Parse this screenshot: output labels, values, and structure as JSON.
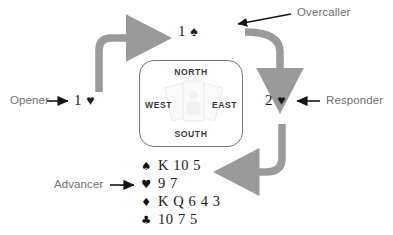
{
  "diagram": {
    "arrow_color": "#9a9a9a",
    "label_color": "#6f6f6f",
    "bid_color": "#1a1a1a"
  },
  "roles": {
    "opener": {
      "label": "Opener",
      "bid_rank": "1",
      "bid_suit": "♥",
      "bid_suit_name": "hearts"
    },
    "overcaller": {
      "label": "Overcaller",
      "bid_rank": "1",
      "bid_suit": "♠",
      "bid_suit_name": "spades"
    },
    "responder": {
      "label": "Responder",
      "bid_rank": "2",
      "bid_suit": "♥",
      "bid_suit_name": "hearts"
    },
    "advancer": {
      "label": "Advancer"
    }
  },
  "compass": {
    "north": "NORTH",
    "west": "WEST",
    "east": "EAST",
    "south": "SOUTH"
  },
  "hand": {
    "rows": [
      {
        "suit": "♠",
        "suit_name": "spades",
        "ranks": "K 10 5"
      },
      {
        "suit": "♥",
        "suit_name": "hearts",
        "ranks": "9 7"
      },
      {
        "suit": "♦",
        "suit_name": "diamonds",
        "ranks": "K Q 6 4 3"
      },
      {
        "suit": "♣",
        "suit_name": "clubs",
        "ranks": "10 7 5"
      }
    ]
  }
}
